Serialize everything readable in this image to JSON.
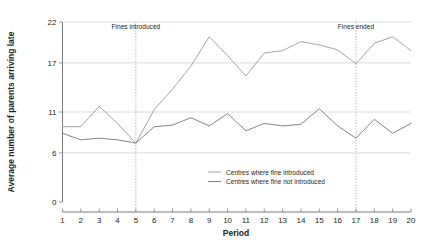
{
  "chart_data": {
    "type": "line",
    "title": "",
    "xlabel": "Period",
    "ylabel": "Average number of parents arriving late",
    "x": [
      1,
      2,
      3,
      4,
      5,
      6,
      7,
      8,
      9,
      10,
      11,
      12,
      13,
      14,
      15,
      16,
      17,
      18,
      19,
      20
    ],
    "xtick_labels": [
      "1",
      "2",
      "3",
      "4",
      "5",
      "6",
      "7",
      "8",
      "9",
      "10",
      "11",
      "12",
      "13",
      "14",
      "15",
      "16",
      "17",
      "18",
      "19",
      "20"
    ],
    "ytick_labels": [
      "0",
      "6",
      "11",
      "17",
      "22"
    ],
    "ytick_values": [
      0,
      6,
      11,
      17,
      22
    ],
    "ylim": [
      0,
      22
    ],
    "xlim": [
      1,
      20
    ],
    "grid": "horizontal",
    "legend_position": "inside-lower-right",
    "series": [
      {
        "name": "Centres where fine introduced",
        "color": "#939598",
        "values": [
          9.2,
          9.2,
          11.7,
          9.6,
          7.2,
          11.3,
          13.8,
          16.6,
          20.2,
          17.9,
          15.4,
          18.2,
          18.5,
          19.6,
          19.2,
          18.6,
          16.9,
          19.4,
          20.2,
          18.5
        ]
      },
      {
        "name": "Centres where fine not introduced",
        "color": "#6d6e71",
        "values": [
          8.4,
          7.6,
          7.8,
          7.6,
          7.2,
          9.2,
          9.4,
          10.3,
          9.3,
          10.8,
          8.7,
          9.6,
          9.3,
          9.5,
          11.4,
          9.3,
          7.8,
          10.1,
          8.4,
          9.6
        ]
      }
    ],
    "annotations": [
      {
        "label": "Fines introduced",
        "at_period": 5
      },
      {
        "label": "Fines ended",
        "at_period": 17
      }
    ]
  }
}
